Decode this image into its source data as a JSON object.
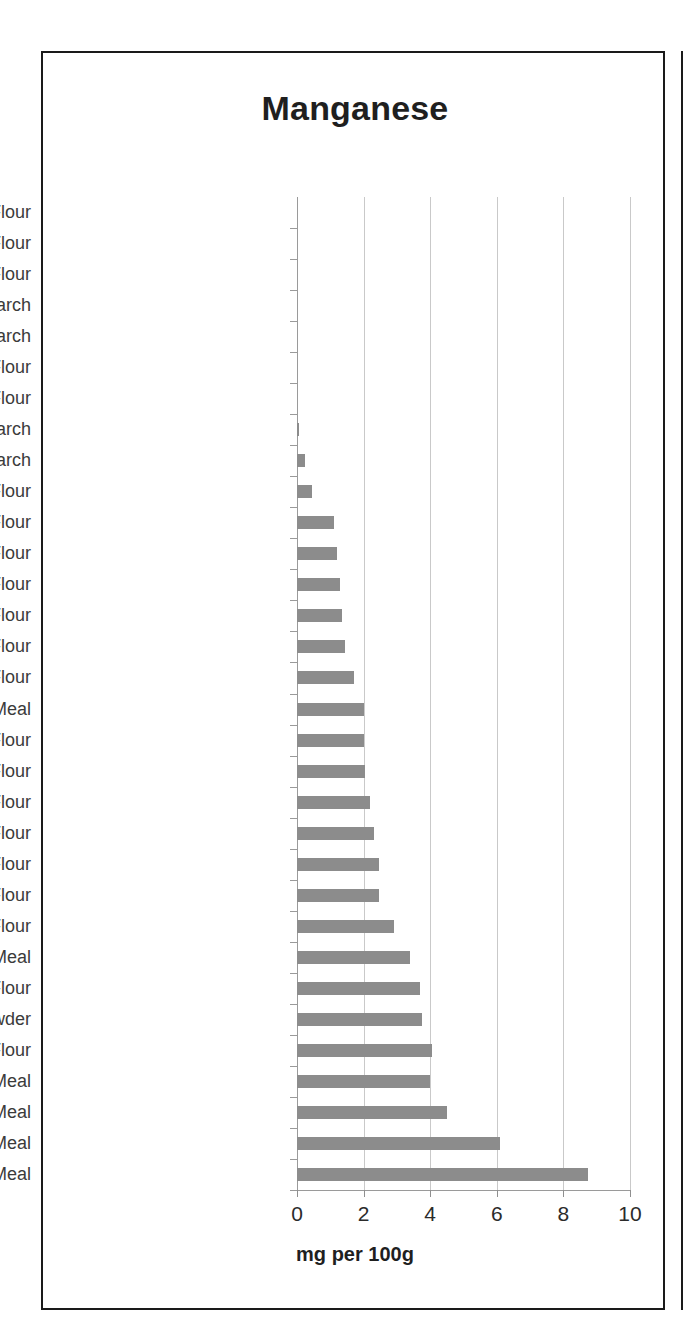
{
  "chart_data": {
    "type": "bar",
    "orientation": "horizontal",
    "title": "Manganese",
    "xlabel": "mg per 100g",
    "ylabel": "",
    "xlim": [
      0,
      10
    ],
    "xticks": [
      0,
      2,
      4,
      6,
      8,
      10
    ],
    "xtick_labels": [
      "0",
      "2",
      "4",
      "6",
      "8",
      "10"
    ],
    "grid": true,
    "legend": false,
    "bar_color": "#8c8c8c",
    "categories": [
      "Coconut Flour",
      "Pure Oat* Flour",
      "Sweet Rice Flour",
      "Potato Starch",
      "Tapioca Starch",
      "Sorghum Flour",
      "Teff Flour",
      "Corn Starch",
      "Arrowroot Starch",
      "Corn Flour",
      "Black Bean Flour",
      "White Rice Flour",
      "White Bean Flour",
      "Buckwheat Flour",
      "Lentil Flour",
      "Millet Flour",
      "Sunflower Seed Meal",
      "Quinoa Flour",
      "Garfava Flour",
      "Chickpea Flour",
      "Amaranth Flour",
      "Soybean Flour",
      "Almond Flour",
      "DF Peanut Flour",
      "Walnut Meal",
      "Brown Rice Flour",
      "Cocoa Powder",
      "Wheat Flour",
      "Macadamia Nut Meal",
      "Pumpkin Seed Meal",
      "Hazelnut Meal",
      "Pine Nut Meal"
    ],
    "values": [
      0,
      0,
      0,
      0,
      0,
      0,
      0,
      0.05,
      0.25,
      0.45,
      1.1,
      1.2,
      1.3,
      1.35,
      1.45,
      1.7,
      2.0,
      2.0,
      2.05,
      2.2,
      2.3,
      2.45,
      2.45,
      2.9,
      3.4,
      3.7,
      3.75,
      4.05,
      4.0,
      4.5,
      6.1,
      8.75
    ]
  }
}
